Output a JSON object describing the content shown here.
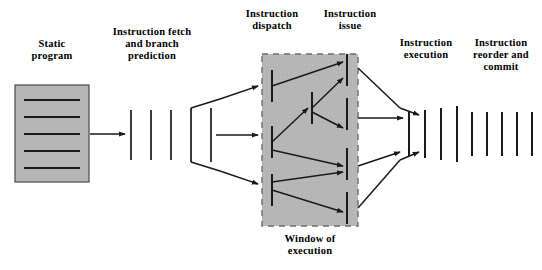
{
  "figure": {
    "title_present": false,
    "background": "#ffffff",
    "ink": "#000000",
    "block_fill": "#b6b6b6",
    "block_stroke": "#4a4a4a",
    "window_fill": "#b6b6b6",
    "window_dash_stroke": "#777777"
  },
  "labels": {
    "static_program": "Static\nprogram",
    "instruction_fetch": "Instruction fetch\nand  branch\nprediction",
    "instruction_dispatch": "Instruction\ndispatch",
    "instruction_issue": "Instruction\nissue",
    "instruction_execution": "Instruction\nexecution",
    "instruction_reorder": "Instruction\nreorder and\ncommit",
    "window_of_execution": "Window of\nexecution"
  },
  "stages": {
    "static_program_box": {
      "x": 15,
      "y": 85,
      "width": 74,
      "height": 97,
      "line_count": 5
    },
    "fetch_bars": {
      "count": 5,
      "xs": [
        131,
        151,
        171,
        191,
        211
      ],
      "y_top": 110,
      "y_bottom": 160
    },
    "window": {
      "x": 262,
      "y": 54,
      "width": 96,
      "height": 172
    },
    "window_left_bars": {
      "count": 3,
      "x": 272,
      "ys": [
        [
          70,
          102
        ],
        [
          126,
          158
        ],
        [
          174,
          206
        ]
      ]
    },
    "window_mid_bars": {
      "count": 1,
      "x": 312,
      "ys": [
        [
          92,
          124
        ]
      ]
    },
    "window_right_bars": {
      "count": 4,
      "x": 347,
      "ys": [
        [
          54,
          86
        ],
        [
          98,
          130
        ],
        [
          148,
          180
        ],
        [
          192,
          224
        ]
      ]
    },
    "execution_bars": {
      "count": 4,
      "xs": [
        409,
        425,
        441,
        457
      ],
      "y_top": 108,
      "y_bottom": 160
    },
    "commit_bars": {
      "count": 5,
      "xs": [
        472,
        487,
        502,
        517,
        532
      ],
      "y_top": 112,
      "y_bottom": 156
    }
  },
  "connections": {
    "program_to_fetch": 1,
    "fetch_to_window": 3,
    "within_window": 8,
    "window_to_execution": 3,
    "execution_to_commit": 2
  }
}
